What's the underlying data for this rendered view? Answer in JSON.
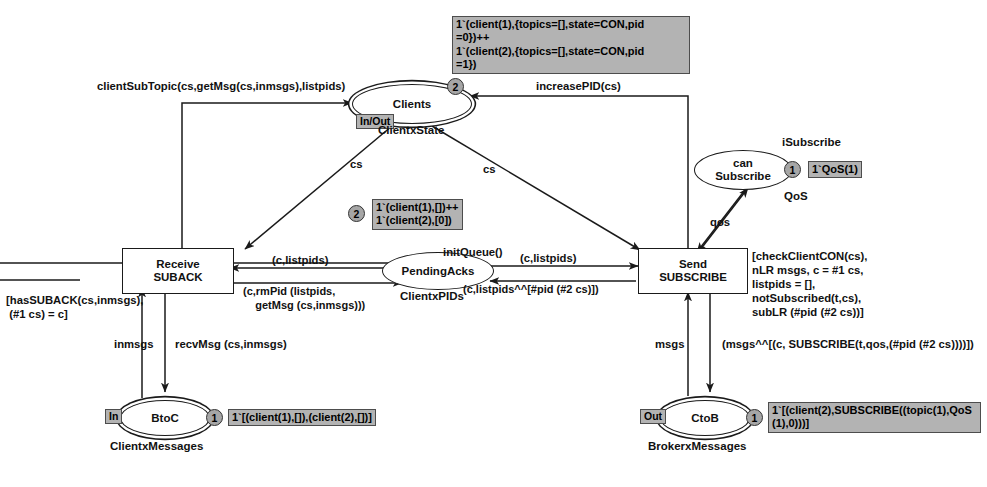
{
  "diagram": {
    "colors": {
      "stroke": "#1a1a1a",
      "marking_bg": "#b3b3b3",
      "token_bg": "#a6a6a6",
      "page_bg": "#ffffff"
    }
  },
  "places": [
    {
      "id": "clients",
      "label": "Clients",
      "type_label": "ClientxState",
      "port": "In/Out",
      "fusion": true,
      "token_count": "2",
      "marking": "1`(client(1),{topics=[],state=CON,pid\n=0})++\n1`(client(2),{topics=[],state=CON,pid\n=1})"
    },
    {
      "id": "can-subscribe",
      "label": "can\nSubscribe",
      "label_line1": "can",
      "label_line2": "Subscribe",
      "type_label": "QoS",
      "name_above": "iSubscribe",
      "port": "",
      "fusion": false,
      "token_count": "1",
      "marking": "1`QoS(1)"
    },
    {
      "id": "pending-acks",
      "label": "PendingAcks",
      "type_label": "ClientxPIDs",
      "port": "",
      "fusion": false,
      "token_count": "2",
      "marking": "1`(client(1),[])++\n1`(client(2),[0])"
    },
    {
      "id": "btoc",
      "label": "BtoC",
      "type_label": "ClientxMessages",
      "port": "In",
      "fusion": true,
      "token_count": "1",
      "marking": "1`[(client(1),[]),(client(2),[])]"
    },
    {
      "id": "ctob",
      "label": "CtoB",
      "type_label": "BrokerxMessages",
      "port": "Out",
      "fusion": true,
      "token_count": "1",
      "marking": "1`[(client(2),SUBSCRIBE((topic(1),QoS\n(1),0)))]"
    }
  ],
  "transitions": [
    {
      "id": "receive-suback",
      "label_line1": "Receive",
      "label_line2": "SUBACK",
      "guard": "[hasSUBACK(cs,inmsgs),\n (#1 cs) = c]"
    },
    {
      "id": "send-subscribe",
      "label_line1": "Send",
      "label_line2": "SUBSCRIBE",
      "guard": "[checkClientCON(cs),\nnLR msgs, c = #1 cs,\nlistpids = [],\nnotSubscribed(t,cs),\nsubLR (#pid (#2 cs))]"
    }
  ],
  "arc_inscriptions": [
    {
      "id": "arc-client-sub-topic",
      "text": "clientSubTopic(cs,getMsg(cs,inmsgs),listpids)"
    },
    {
      "id": "arc-increase-pid",
      "text": "increasePID(cs)"
    },
    {
      "id": "arc-cs-left",
      "text": "cs"
    },
    {
      "id": "arc-cs-right",
      "text": "cs"
    },
    {
      "id": "arc-init-queue",
      "text": "initQueue()"
    },
    {
      "id": "arc-c-listpids-left",
      "text": "(c,listpids)"
    },
    {
      "id": "arc-c-rmpid",
      "text": "(c,rmPid (listpids,\n    getMsg (cs,inmsgs)))"
    },
    {
      "id": "arc-c-listpids-right",
      "text": "(c,listpids)"
    },
    {
      "id": "arc-c-listpids-append",
      "text": "(c,listpids^^[#pid (#2 cs)])"
    },
    {
      "id": "arc-qos",
      "text": "qos"
    },
    {
      "id": "arc-inmsgs",
      "text": "inmsgs"
    },
    {
      "id": "arc-recv-msg",
      "text": "recvMsg (cs,inmsgs)"
    },
    {
      "id": "arc-msgs",
      "text": "msgs"
    },
    {
      "id": "arc-msgs-append",
      "text": "(msgs^^[(c, SUBSCRIBE(t,qos,(#pid (#2 cs))))])"
    }
  ]
}
